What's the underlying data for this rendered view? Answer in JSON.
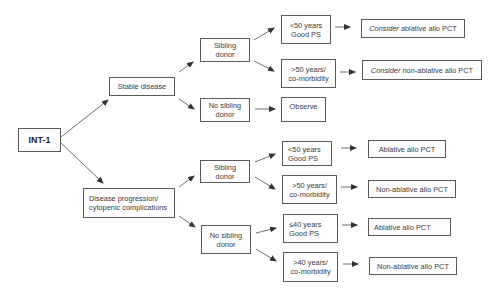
{
  "diagram": {
    "type": "decision-tree",
    "colors": {
      "line": "#4a4a4a",
      "border": "#5a5a5a",
      "text": "#3a3a3a",
      "background": "#ffffff"
    },
    "root": {
      "label": "INT-1"
    },
    "branches": {
      "stable": {
        "label": "Stable disease",
        "sibling": {
          "label": "Sibling\ndonor",
          "young": {
            "label": "<50 years\nGood PS",
            "outcome_prefix": "Consider",
            "outcome_rest": " ablative allo PCT"
          },
          "old": {
            "label": ">50 years/\nco-morbidity",
            "outcome_prefix": "Consider",
            "outcome_rest": " non-ablative allo PCT"
          }
        },
        "no_sibling": {
          "label": "No sibling\ndonor",
          "outcome": "Observe"
        }
      },
      "progression": {
        "label": "Disease progression/\ncytopenic complications",
        "sibling": {
          "label": "Sibling\ndonor",
          "young": {
            "label": "<50 years\nGood PS",
            "outcome": "Ablative allo PCT"
          },
          "old": {
            "label": ">50 years/\nco-morbidity",
            "outcome": "Non-ablative allo PCT"
          }
        },
        "no_sibling": {
          "label": "No sibling\ndonor",
          "young": {
            "label": "≤40 years\nGood PS",
            "outcome": "Ablative allo PCT"
          },
          "old": {
            "label": ">40 years/\nco-morbidity",
            "outcome": "Non-ablative allo PCT"
          }
        }
      }
    }
  }
}
